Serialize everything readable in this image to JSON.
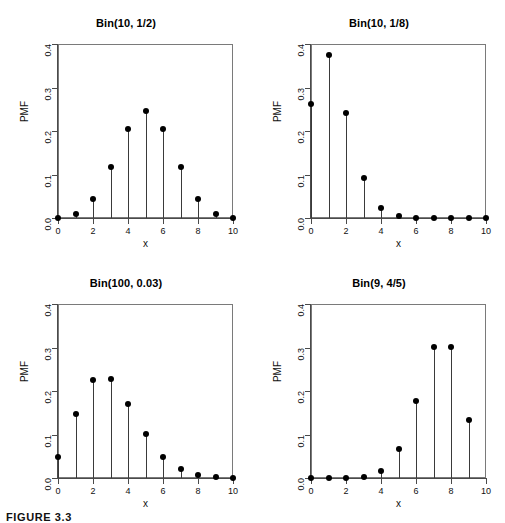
{
  "figure": {
    "caption": "FIGURE 3.3",
    "background": "#ffffff",
    "point_color": "#000000",
    "stem_color": "#3a3a3a",
    "axis_color": "#4a4a4a"
  },
  "chart_data": [
    {
      "type": "scatter",
      "title": "Bin(10, 1/2)",
      "xlabel": "x",
      "ylabel": "PMF",
      "xlim": [
        0,
        10
      ],
      "ylim": [
        0,
        0.4
      ],
      "xticks": [
        0,
        2,
        4,
        6,
        8,
        10
      ],
      "xticklabels": [
        "0",
        "2",
        "4",
        "6",
        "8",
        "10"
      ],
      "yticks": [
        0.0,
        0.1,
        0.2,
        0.3,
        0.4
      ],
      "yticklabels": [
        "0.0",
        "0.1",
        "0.2",
        "0.3",
        "0.4"
      ],
      "grid": false,
      "legend": null,
      "x": [
        0,
        1,
        2,
        3,
        4,
        5,
        6,
        7,
        8,
        9,
        10
      ],
      "values": [
        0.001,
        0.01,
        0.044,
        0.117,
        0.205,
        0.246,
        0.205,
        0.117,
        0.044,
        0.01,
        0.001
      ]
    },
    {
      "type": "scatter",
      "title": "Bin(10, 1/8)",
      "xlabel": "x",
      "ylabel": "PMF",
      "xlim": [
        0,
        10
      ],
      "ylim": [
        0,
        0.4
      ],
      "xticks": [
        0,
        2,
        4,
        6,
        8,
        10
      ],
      "xticklabels": [
        "0",
        "2",
        "4",
        "6",
        "8",
        "10"
      ],
      "yticks": [
        0.0,
        0.1,
        0.2,
        0.3,
        0.4
      ],
      "yticklabels": [
        "0.0",
        "0.1",
        "0.2",
        "0.3",
        "0.4"
      ],
      "grid": false,
      "legend": null,
      "x": [
        0,
        1,
        2,
        3,
        4,
        5,
        6,
        7,
        8,
        9,
        10
      ],
      "values": [
        0.263,
        0.375,
        0.241,
        0.092,
        0.023,
        0.004,
        0.0005,
        5e-05,
        3e-06,
        1e-07,
        0.0
      ]
    },
    {
      "type": "scatter",
      "title": "Bin(100, 0.03)",
      "xlabel": "x",
      "ylabel": "PMF",
      "xlim": [
        0,
        10
      ],
      "ylim": [
        0,
        0.4
      ],
      "xticks": [
        0,
        2,
        4,
        6,
        8,
        10
      ],
      "xticklabels": [
        "0",
        "2",
        "4",
        "6",
        "8",
        "10"
      ],
      "yticks": [
        0.0,
        0.1,
        0.2,
        0.3,
        0.4
      ],
      "yticklabels": [
        "0.0",
        "0.1",
        "0.2",
        "0.3",
        "0.4"
      ],
      "grid": false,
      "legend": null,
      "x": [
        0,
        1,
        2,
        3,
        4,
        5,
        6,
        7,
        8,
        9,
        10
      ],
      "values": [
        0.048,
        0.147,
        0.225,
        0.227,
        0.171,
        0.101,
        0.049,
        0.02,
        0.007,
        0.002,
        0.0005
      ]
    },
    {
      "type": "scatter",
      "title": "Bin(9, 4/5)",
      "xlabel": "x",
      "ylabel": "PMF",
      "xlim": [
        0,
        10
      ],
      "ylim": [
        0,
        0.4
      ],
      "xticks": [
        0,
        2,
        4,
        6,
        8,
        10
      ],
      "xticklabels": [
        "0",
        "2",
        "4",
        "6",
        "8",
        "10"
      ],
      "yticks": [
        0.0,
        0.1,
        0.2,
        0.3,
        0.4
      ],
      "yticklabels": [
        "0.0",
        "0.1",
        "0.2",
        "0.3",
        "0.4"
      ],
      "grid": false,
      "legend": null,
      "x": [
        0,
        1,
        2,
        3,
        4,
        5,
        6,
        7,
        8,
        9
      ],
      "values": [
        5e-07,
        2e-05,
        0.0003,
        0.003,
        0.017,
        0.066,
        0.176,
        0.302,
        0.302,
        0.134
      ]
    }
  ]
}
